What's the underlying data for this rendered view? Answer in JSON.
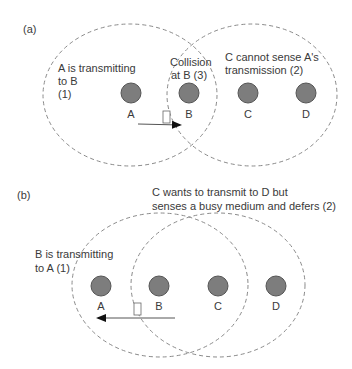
{
  "panel_a": {
    "tag": "(a)",
    "annotations": {
      "a_transmitting_line1": "A is transmitting",
      "a_transmitting_line2": "to B",
      "a_transmitting_line3": "(1)",
      "collision_line1": "Collision",
      "collision_line2": "at B (3)",
      "c_cannot_line1": "C cannot sense A's",
      "c_cannot_line2": "transmission (2)"
    },
    "nodes": [
      "A",
      "B",
      "C",
      "D"
    ]
  },
  "panel_b": {
    "tag": "(b)",
    "annotations": {
      "c_wants_line1": "C wants to transmit to D but",
      "c_wants_line2": "senses a busy medium and defers (2)",
      "b_transmitting_line1": "B is transmitting",
      "b_transmitting_line2": "to A (1)"
    },
    "nodes": [
      "A",
      "B",
      "C",
      "D"
    ]
  },
  "colors": {
    "node_fill": "#7d7d7d",
    "node_stroke": "#555555",
    "dashed_range": "#8a8a8a",
    "arrow": "#555555"
  }
}
